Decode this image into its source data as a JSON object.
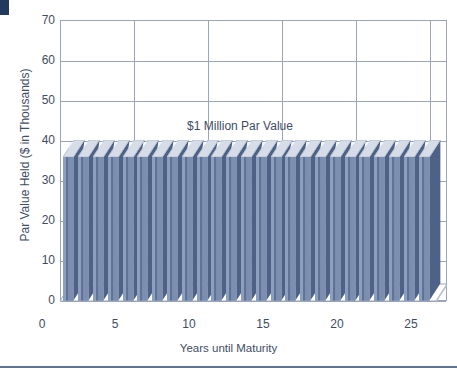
{
  "page": {
    "background_color": "#ffffff",
    "corner_mark_color": "#23395e",
    "rule_color": "#5d7595",
    "text_color": "#3e4d66"
  },
  "chart_data": {
    "type": "bar",
    "title": "",
    "annotation": "$1 Million Par Value",
    "xlabel": "Years until Maturity",
    "ylabel": "Par Value Held ($ in Thousands)",
    "ylim": [
      0,
      70
    ],
    "xlim": [
      0,
      25
    ],
    "ytick_labels": [
      "0",
      "10",
      "20",
      "30",
      "40",
      "50",
      "60",
      "70"
    ],
    "ytick_values": [
      0,
      10,
      20,
      30,
      40,
      50,
      60,
      70
    ],
    "xtick_labels": [
      "0",
      "5",
      "10",
      "15",
      "20",
      "25"
    ],
    "xtick_values": [
      0,
      5,
      10,
      15,
      20,
      25
    ],
    "grid": "horizontal-and-vertical",
    "legend": "none",
    "style": "3d-bar",
    "series": [
      {
        "name": "Par Value Held",
        "values": [
          40,
          40,
          40,
          40,
          40,
          40,
          40,
          40,
          40,
          40,
          40,
          40,
          40,
          40,
          40,
          40,
          40,
          40,
          40,
          40,
          40,
          40,
          40,
          40,
          40
        ]
      }
    ],
    "categories": [
      1,
      2,
      3,
      4,
      5,
      6,
      7,
      8,
      9,
      10,
      11,
      12,
      13,
      14,
      15,
      16,
      17,
      18,
      19,
      20,
      21,
      22,
      23,
      24,
      25
    ],
    "bar_count": 25,
    "bar_front_color": "#7186a8",
    "bar_side_color": "#4e6288",
    "bar_top_color": "#d6dde8",
    "grid_color": "#9aa6b8"
  }
}
